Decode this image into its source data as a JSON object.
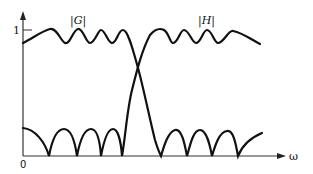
{
  "diagram": {
    "type": "frequency-response-sketch",
    "axes": {
      "x_label": "ω",
      "y_tick_label": "1",
      "origin_label": "0"
    },
    "curves": [
      {
        "name": "G",
        "label": "|G|",
        "kind": "lowpass"
      },
      {
        "name": "H",
        "label": "|H|",
        "kind": "highpass"
      }
    ],
    "colors": {
      "curve": "#111111",
      "axis": "#333333",
      "background": "#ffffff"
    }
  }
}
